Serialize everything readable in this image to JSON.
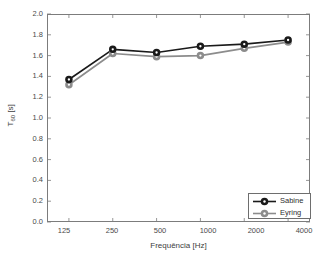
{
  "chart_data": {
    "type": "line",
    "title": "",
    "xlabel": "Frequência [Hz]",
    "ylabel": "T60 [s]",
    "ylabel_base": "T",
    "ylabel_sub": "60",
    "ylabel_unit": " [s]",
    "categories": [
      "125",
      "250",
      "500",
      "1000",
      "2000",
      "4000"
    ],
    "xtick_labels": [
      "125",
      "250",
      "500",
      "1000",
      "2000",
      "4000"
    ],
    "ytick_labels": [
      "2.0",
      "1.8",
      "1.6",
      "1.4",
      "1.2",
      "1.0",
      "0.8",
      "0.6",
      "0.4",
      "0.2",
      "0.0"
    ],
    "ylim": [
      0.0,
      2.0
    ],
    "ytick_step": 0.2,
    "grid": false,
    "legend_position": "bottom-right",
    "series": [
      {
        "name": "Sabine",
        "color": "#1a1a1a",
        "marker": "circle",
        "values": [
          1.37,
          1.66,
          1.63,
          1.69,
          1.71,
          1.75
        ]
      },
      {
        "name": "Eyring",
        "color": "#8c8c8c",
        "marker": "circle",
        "values": [
          1.32,
          1.62,
          1.59,
          1.6,
          1.67,
          1.73
        ]
      }
    ]
  },
  "legend": {
    "entries": [
      {
        "label": "Sabine"
      },
      {
        "label": "Eyring"
      }
    ]
  },
  "colors": {
    "sabine": "#1a1a1a",
    "eyring": "#8c8c8c",
    "axis": "#7c7c7c",
    "background": "#ffffff"
  }
}
